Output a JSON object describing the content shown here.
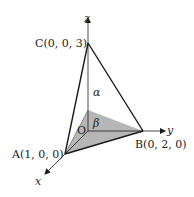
{
  "figure": {
    "axes": {
      "x_label": "x",
      "y_label": "y",
      "z_label": "z"
    },
    "origin_label": "O",
    "points": {
      "A": {
        "label": "A(1, 0, 0)",
        "coords": [
          1,
          0,
          0
        ]
      },
      "B": {
        "label": "B(0, 2, 0)",
        "coords": [
          0,
          2,
          0
        ]
      },
      "C": {
        "label": "C(0, 0, 3)",
        "coords": [
          0,
          0,
          3
        ]
      }
    },
    "angles": {
      "alpha": "α",
      "beta": "β"
    },
    "colors": {
      "line": "#1a1a1a",
      "shaded_region": "#a9a9a9",
      "background": "#ffffff"
    }
  }
}
